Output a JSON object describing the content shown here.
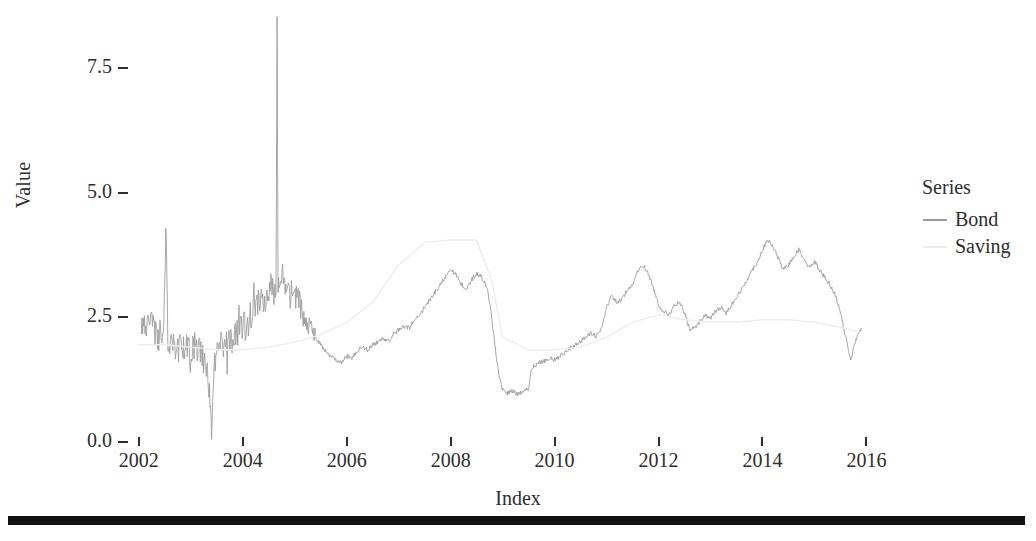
{
  "chart_data": {
    "type": "line",
    "title": "",
    "xlabel": "Index",
    "ylabel": "Value",
    "xlim": [
      2001.6,
      2016.8
    ],
    "ylim": [
      0.0,
      8.7
    ],
    "grid": false,
    "legend_position": "right",
    "legend_title": "Series",
    "x_ticks": [
      "2002",
      "2004",
      "2006",
      "2008",
      "2010",
      "2012",
      "2014",
      "2016"
    ],
    "x_tick_values": [
      2002,
      2004,
      2006,
      2008,
      2010,
      2012,
      2014,
      2016
    ],
    "y_ticks": [
      "0.0",
      "2.5",
      "5.0",
      "7.5"
    ],
    "y_tick_values": [
      0.0,
      2.5,
      5.0,
      7.5
    ],
    "colors": {
      "bond": "#9a9a9a",
      "saving": "#ededed",
      "axis_text": "#2e2e2e",
      "background": "#ffffff",
      "rule": "#111111"
    },
    "series": [
      {
        "name": "Bond",
        "color": "#9a9a9a",
        "x": [
          2002.05,
          2002.12,
          2002.18,
          2002.24,
          2002.3,
          2002.36,
          2002.42,
          2002.48,
          2002.52,
          2002.56,
          2002.62,
          2002.68,
          2002.74,
          2002.8,
          2002.86,
          2002.92,
          2002.98,
          2003.04,
          2003.1,
          2003.16,
          2003.22,
          2003.28,
          2003.32,
          2003.36,
          2003.4,
          2003.46,
          2003.52,
          2003.58,
          2003.64,
          2003.7,
          2003.76,
          2003.82,
          2003.88,
          2003.94,
          2004.0,
          2004.06,
          2004.12,
          2004.18,
          2004.24,
          2004.3,
          2004.36,
          2004.42,
          2004.48,
          2004.54,
          2004.6,
          2004.64,
          2004.66,
          2004.68,
          2004.72,
          2004.78,
          2004.84,
          2004.9,
          2004.96,
          2005.02,
          2005.08,
          2005.14,
          2005.2,
          2005.3,
          2005.4,
          2005.5,
          2005.6,
          2005.7,
          2005.8,
          2005.9,
          2006.0,
          2006.1,
          2006.2,
          2006.3,
          2006.4,
          2006.5,
          2006.6,
          2006.7,
          2006.8,
          2006.9,
          2007.0,
          2007.1,
          2007.2,
          2007.3,
          2007.4,
          2007.5,
          2007.6,
          2007.7,
          2007.8,
          2007.9,
          2008.0,
          2008.1,
          2008.2,
          2008.3,
          2008.4,
          2008.5,
          2008.6,
          2008.7,
          2008.75,
          2008.8,
          2008.85,
          2008.9,
          2008.95,
          2009.0,
          2009.1,
          2009.2,
          2009.3,
          2009.4,
          2009.5,
          2009.55,
          2009.6,
          2009.7,
          2009.8,
          2009.9,
          2010.0,
          2010.1,
          2010.2,
          2010.3,
          2010.4,
          2010.5,
          2010.6,
          2010.7,
          2010.8,
          2010.9,
          2011.0,
          2011.1,
          2011.2,
          2011.3,
          2011.4,
          2011.5,
          2011.6,
          2011.7,
          2011.8,
          2011.9,
          2012.0,
          2012.1,
          2012.2,
          2012.3,
          2012.4,
          2012.5,
          2012.6,
          2012.7,
          2012.8,
          2012.9,
          2013.0,
          2013.1,
          2013.2,
          2013.3,
          2013.4,
          2013.5,
          2013.6,
          2013.7,
          2013.8,
          2013.9,
          2014.0,
          2014.1,
          2014.2,
          2014.3,
          2014.4,
          2014.5,
          2014.6,
          2014.7,
          2014.8,
          2014.9,
          2015.0,
          2015.1,
          2015.2,
          2015.3,
          2015.4,
          2015.5,
          2015.6,
          2015.7,
          2015.8,
          2015.9
        ],
        "y": [
          2.42,
          2.36,
          2.28,
          2.52,
          2.2,
          2.1,
          2.18,
          2.05,
          4.45,
          2.02,
          1.95,
          2.0,
          1.88,
          1.92,
          1.85,
          1.9,
          1.82,
          1.95,
          1.88,
          1.8,
          1.72,
          1.6,
          1.4,
          0.95,
          0.35,
          1.55,
          1.78,
          1.92,
          1.85,
          2.05,
          2.12,
          2.0,
          2.15,
          2.22,
          2.35,
          2.28,
          2.45,
          2.6,
          2.72,
          2.85,
          2.95,
          2.88,
          3.05,
          3.12,
          3.0,
          3.2,
          8.55,
          3.25,
          3.1,
          3.18,
          3.02,
          2.95,
          3.05,
          2.9,
          2.78,
          2.65,
          2.52,
          2.3,
          2.1,
          1.95,
          1.8,
          1.72,
          1.65,
          1.6,
          1.72,
          1.68,
          1.82,
          1.9,
          1.85,
          1.95,
          2.0,
          2.08,
          2.02,
          2.15,
          2.25,
          2.32,
          2.28,
          2.45,
          2.55,
          2.7,
          2.85,
          3.0,
          3.15,
          3.32,
          3.48,
          3.35,
          3.18,
          3.05,
          3.25,
          3.38,
          3.3,
          3.1,
          2.8,
          2.4,
          1.95,
          1.55,
          1.25,
          1.05,
          0.98,
          1.02,
          0.95,
          1.0,
          1.08,
          1.45,
          1.52,
          1.58,
          1.62,
          1.68,
          1.65,
          1.72,
          1.8,
          1.88,
          1.95,
          2.02,
          2.1,
          2.18,
          2.12,
          2.25,
          2.7,
          2.95,
          2.78,
          2.88,
          3.05,
          3.15,
          3.42,
          3.55,
          3.38,
          3.1,
          2.75,
          2.62,
          2.55,
          2.72,
          2.8,
          2.58,
          2.25,
          2.3,
          2.42,
          2.55,
          2.48,
          2.62,
          2.7,
          2.58,
          2.75,
          2.9,
          3.05,
          3.25,
          3.45,
          3.6,
          3.85,
          4.05,
          3.92,
          3.7,
          3.45,
          3.55,
          3.72,
          3.85,
          3.68,
          3.5,
          3.62,
          3.45,
          3.3,
          3.15,
          2.95,
          2.6,
          2.1,
          1.65,
          2.05,
          2.28
        ]
      },
      {
        "name": "Saving",
        "color": "#ededed",
        "x": [
          2002.0,
          2002.5,
          2003.0,
          2003.5,
          2004.0,
          2004.5,
          2005.0,
          2005.5,
          2006.0,
          2006.5,
          2007.0,
          2007.5,
          2008.0,
          2008.5,
          2008.8,
          2009.0,
          2009.5,
          2010.0,
          2010.5,
          2011.0,
          2011.5,
          2012.0,
          2012.5,
          2013.0,
          2013.5,
          2014.0,
          2014.5,
          2015.0,
          2015.5,
          2015.9
        ],
        "y": [
          1.95,
          1.95,
          1.9,
          1.85,
          1.85,
          1.9,
          2.0,
          2.15,
          2.4,
          2.8,
          3.55,
          4.0,
          4.05,
          4.05,
          3.2,
          2.1,
          1.85,
          1.85,
          1.9,
          2.1,
          2.4,
          2.55,
          2.45,
          2.4,
          2.4,
          2.45,
          2.45,
          2.4,
          2.3,
          2.2
        ]
      }
    ]
  },
  "axes": {
    "y_title": "Value",
    "x_title": "Index"
  },
  "legend": {
    "title": "Series",
    "items": [
      {
        "label": "Bond",
        "color": "#9a9a9a"
      },
      {
        "label": "Saving",
        "color": "#ededed"
      }
    ]
  }
}
